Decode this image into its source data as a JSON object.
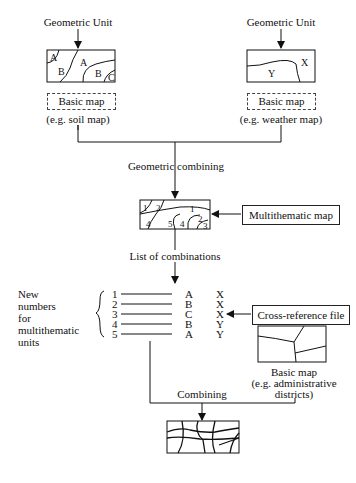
{
  "left_source": {
    "title": "Geometric Unit",
    "map_labels": [
      "A",
      "B",
      "A",
      "B",
      "C"
    ],
    "box_label": "Basic map",
    "caption": "(e.g. soil map)"
  },
  "right_source": {
    "title": "Geometric Unit",
    "map_labels": [
      "X",
      "Y"
    ],
    "box_label": "Basic map",
    "caption": "(e.g. weather map)"
  },
  "step1": "Geometric combining",
  "multithematic": {
    "label": "Multithematic map",
    "map_labels": [
      "1",
      "2",
      "1",
      "4",
      "5",
      "4",
      "2",
      "3"
    ]
  },
  "step2": "List of combinations",
  "new_numbers_label": [
    "New",
    "numbers",
    "for",
    "multithematic",
    "units"
  ],
  "combinations": [
    {
      "num": "1",
      "a": "A",
      "b": "X"
    },
    {
      "num": "2",
      "a": "B",
      "b": "X"
    },
    {
      "num": "3",
      "a": "C",
      "b": "X"
    },
    {
      "num": "4",
      "a": "B",
      "b": "Y"
    },
    {
      "num": "5",
      "a": "A",
      "b": "Y"
    }
  ],
  "cross_ref": "Cross-reference file",
  "admin_map": {
    "label": "Basic map",
    "caption_1": "(e.g. administrative",
    "caption_2": "districts)"
  },
  "step3": "Combining"
}
